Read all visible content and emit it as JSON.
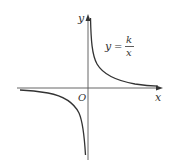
{
  "figure": {
    "type": "function-graph",
    "function_label": {
      "lhs": "y",
      "equals": "=",
      "numerator": "k",
      "denominator": "x"
    },
    "axes": {
      "x_label": "x",
      "y_label": "y",
      "origin_label": "O"
    },
    "curve": {
      "description": "hyperbola y = k/x with k > 0, branches in quadrants I and III",
      "color": "#333333"
    },
    "axis_color": "#555555"
  }
}
